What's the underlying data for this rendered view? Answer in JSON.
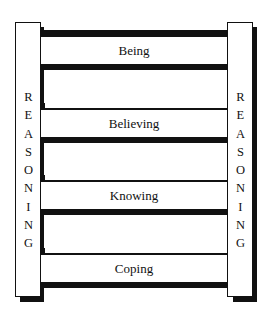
{
  "diagram": {
    "type": "ladder",
    "posts": {
      "left": {
        "label": "REASONING"
      },
      "right": {
        "label": "REASONING"
      }
    },
    "rungs": [
      {
        "label": "Being"
      },
      {
        "label": "Believing"
      },
      {
        "label": "Knowing"
      },
      {
        "label": "Coping"
      }
    ],
    "colors": {
      "line": "#111111",
      "fill": "#ffffff"
    }
  }
}
